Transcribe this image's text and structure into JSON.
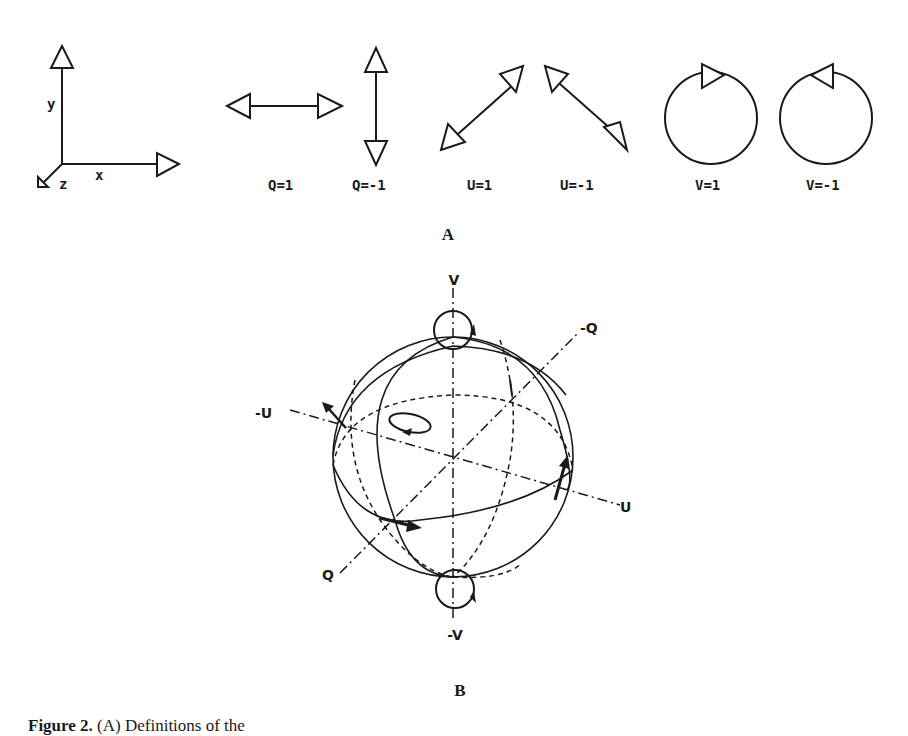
{
  "figure": {
    "panel_a": {
      "label": "A",
      "axes": {
        "x_label": "x",
        "y_label": "y",
        "z_label": "z"
      },
      "polarizations": [
        {
          "id": "q-pos",
          "label": "Q=1",
          "orientation": "horizontal linear"
        },
        {
          "id": "q-neg",
          "label": "Q=-1",
          "orientation": "vertical linear"
        },
        {
          "id": "u-pos",
          "label": "U=1",
          "orientation": "+45 degree linear"
        },
        {
          "id": "u-neg",
          "label": "U=-1",
          "orientation": "-45 degree linear"
        },
        {
          "id": "v-pos",
          "label": "V=1",
          "orientation": "circular, arrow pointing right"
        },
        {
          "id": "v-neg",
          "label": "V=-1",
          "orientation": "circular, arrow pointing left"
        }
      ]
    },
    "panel_b": {
      "label": "B",
      "title": "Poincaré sphere",
      "axis_labels": {
        "v_pos": "V",
        "v_neg": "-V",
        "q_pos": "Q",
        "q_neg": "-Q",
        "u_pos": "U",
        "u_neg": "-U"
      }
    },
    "caption": {
      "prefix": "Figure 2.",
      "text": "(A) Definitions of the"
    }
  }
}
